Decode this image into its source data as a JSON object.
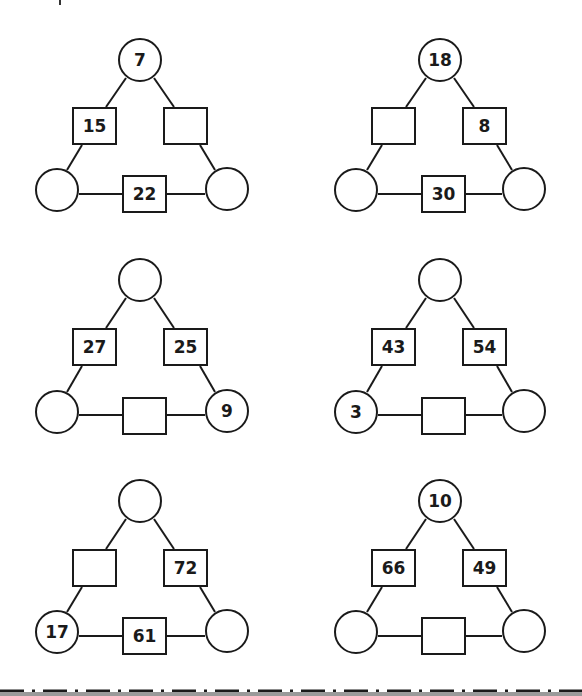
{
  "worksheet": {
    "puzzles": [
      {
        "id": 1,
        "top": "7",
        "left_box": "15",
        "right_box": "",
        "bottom_left": "",
        "bottom_box": "22",
        "bottom_right": ""
      },
      {
        "id": 2,
        "top": "18",
        "left_box": "",
        "right_box": "8",
        "bottom_left": "",
        "bottom_box": "30",
        "bottom_right": ""
      },
      {
        "id": 3,
        "top": "",
        "left_box": "27",
        "right_box": "25",
        "bottom_left": "",
        "bottom_box": "",
        "bottom_right": "9"
      },
      {
        "id": 4,
        "top": "",
        "left_box": "43",
        "right_box": "54",
        "bottom_left": "3",
        "bottom_box": "",
        "bottom_right": ""
      },
      {
        "id": 5,
        "top": "",
        "left_box": "",
        "right_box": "72",
        "bottom_left": "17",
        "bottom_box": "61",
        "bottom_right": ""
      },
      {
        "id": 6,
        "top": "10",
        "left_box": "66",
        "right_box": "49",
        "bottom_left": "",
        "bottom_box": "",
        "bottom_right": ""
      }
    ]
  },
  "colors": {
    "stroke": "#1a1a1a",
    "background": "#ffffff",
    "band": "#9a9a9a"
  }
}
